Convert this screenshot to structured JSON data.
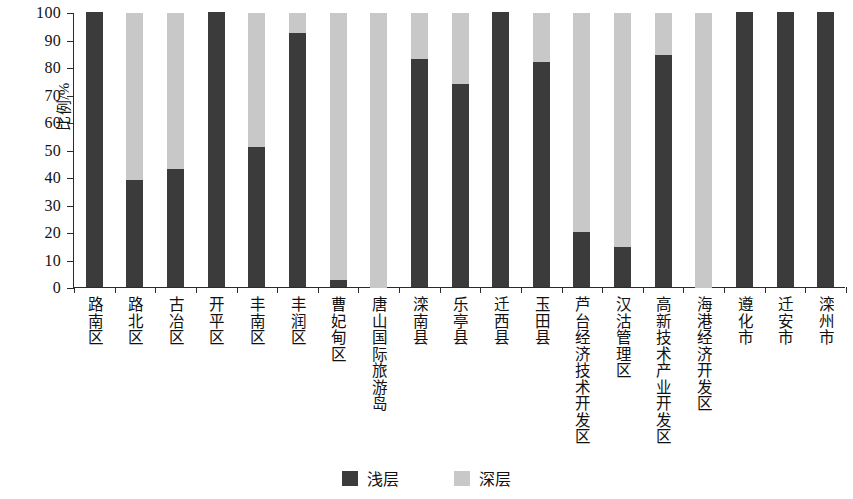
{
  "chart_data": {
    "type": "bar",
    "stacked": true,
    "stack_total": 100,
    "title": "",
    "subtitle": "",
    "xlabel": "",
    "ylabel": "比例/%",
    "ylim": [
      0,
      100
    ],
    "ytick_step": 10,
    "ytick_labels": [
      "0",
      "10",
      "20",
      "30",
      "40",
      "50",
      "60",
      "70",
      "80",
      "90",
      "100"
    ],
    "grid": false,
    "legend_position": "bottom-center",
    "categories": [
      "路南区",
      "路北区",
      "古冶区",
      "开平区",
      "丰南区",
      "丰润区",
      "曹妃甸区",
      "唐山国际旅游岛",
      "滦南县",
      "乐亭县",
      "迁西县",
      "玉田县",
      "芦台经济技术开发区",
      "汉沽管理区",
      "高新技术产业开发区",
      "海港经济开发区",
      "遵化市",
      "迁安市",
      "滦州市"
    ],
    "series": [
      {
        "name": "浅层",
        "color": "#3b3b3b",
        "values": [
          100,
          39,
          43,
          100,
          51,
          92.5,
          2.5,
          0,
          83,
          74,
          100,
          82,
          20,
          14.5,
          84.5,
          0,
          100,
          100,
          100
        ]
      },
      {
        "name": "深层",
        "color": "#c8c8c8",
        "values": [
          0,
          61,
          57,
          0,
          49,
          7.5,
          97.5,
          100,
          17,
          26,
          0,
          18,
          80,
          85.5,
          15.5,
          100,
          0,
          0,
          0
        ]
      }
    ]
  },
  "legend": {
    "items": [
      {
        "label": "浅层",
        "color": "#3b3b3b",
        "swatch": "legend-swatch-shallow"
      },
      {
        "label": "深层",
        "color": "#c8c8c8",
        "swatch": "legend-swatch-deep"
      }
    ]
  },
  "axes": {
    "y_title": "比例/%"
  }
}
